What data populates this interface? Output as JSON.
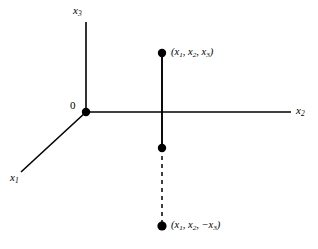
{
  "figure": {
    "type": "coordinate-axes-diagram",
    "background_color": "#ffffff",
    "stroke_color": "#000000",
    "axes": [
      {
        "name": "x1",
        "label": "x",
        "subscript": "1",
        "direction": "lower-left-diagonal"
      },
      {
        "name": "x2",
        "label": "x",
        "subscript": "2",
        "direction": "right-horizontal"
      },
      {
        "name": "x3",
        "label": "x",
        "subscript": "3",
        "direction": "up-vertical"
      }
    ],
    "origin": {
      "label": "0"
    },
    "points": [
      {
        "name": "point-upper",
        "label": "(x₁, x₂, x₃)"
      },
      {
        "name": "point-middle",
        "label": ""
      },
      {
        "name": "point-lower",
        "label": "(x₁, x₂, −x₃)"
      }
    ],
    "labels": {
      "x1": "x",
      "x1_sub": "1",
      "x2": "x",
      "x2_sub": "2",
      "x3": "x",
      "x3_sub": "3",
      "origin": "0",
      "point_top_open": "(",
      "point_top": "x",
      "point_top_sub1": "1",
      "point_top_sep1": ", ",
      "point_top_sub2": "2",
      "point_top_sep2": ", ",
      "point_top_sub3": "3",
      "point_top_close": ")",
      "point_bottom_open": "(",
      "point_bottom_sub1": "1",
      "point_bottom_sep1": ", ",
      "point_bottom_sub2": "2",
      "point_bottom_sep2": ", −",
      "point_bottom_sub3": "3",
      "point_bottom_close": ")"
    }
  }
}
